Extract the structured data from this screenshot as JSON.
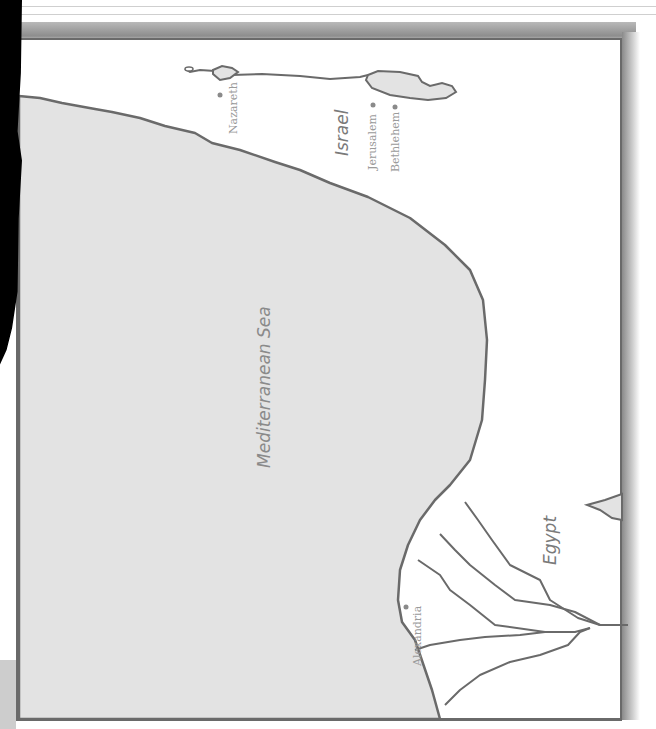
{
  "map": {
    "water_color": "#e3e3e3",
    "coast_color": "#6a6a6a",
    "land_color": "#ffffff",
    "labels": {
      "sea": "Mediterranean Sea",
      "region_israel": "Israel",
      "region_egypt": "Egypt"
    },
    "cities": [
      {
        "name": "Nazareth",
        "x": 220,
        "y": 95
      },
      {
        "name": "Jerusalem",
        "x": 373,
        "y": 106
      },
      {
        "name": "Bethlehem",
        "x": 396,
        "y": 108
      },
      {
        "name": "Alexandria",
        "x": 406,
        "y": 606
      }
    ]
  }
}
